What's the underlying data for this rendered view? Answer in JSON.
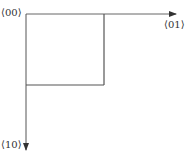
{
  "diagram": {
    "type": "coordinate-axes-with-rectangle",
    "labels": {
      "origin": "⟨00⟩",
      "x_axis_end": "⟨01⟩",
      "y_axis_end": "⟨10⟩"
    },
    "colors": {
      "line": "#555555",
      "text": "#333333",
      "background": "#ffffff"
    }
  }
}
